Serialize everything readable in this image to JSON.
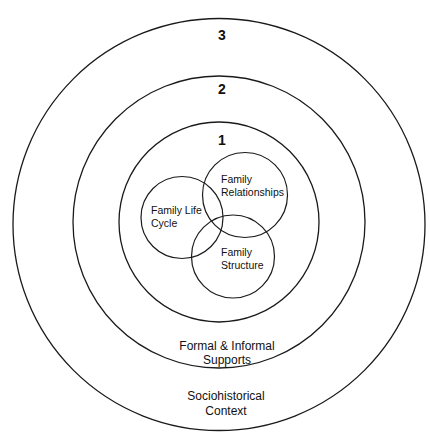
{
  "diagram": {
    "level3": {
      "number": "3",
      "label_line1": "Sociohistorical",
      "label_line2": "Context"
    },
    "level2": {
      "number": "2",
      "label_line1": "Formal & Informal",
      "label_line2": "Supports"
    },
    "level1": {
      "number": "1"
    },
    "family_relationships": {
      "line1": "Family",
      "line2": "Relationships"
    },
    "family_life_cycle": {
      "line1": "Family Life",
      "line2": "Cycle"
    },
    "family_structure": {
      "line1": "Family",
      "line2": "Structure"
    }
  },
  "colors": {
    "line": "#1a1a1a",
    "text": "#111111",
    "background": "#ffffff"
  }
}
